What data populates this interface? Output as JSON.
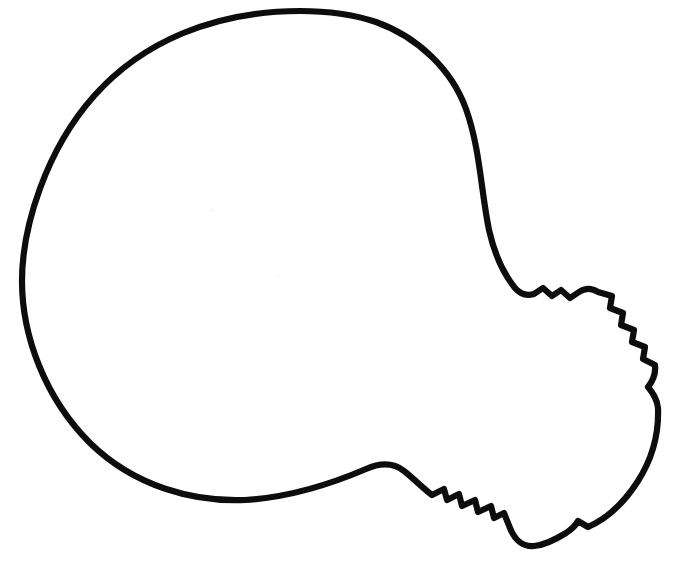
{
  "document": {
    "kind": "line-art-coloring-page",
    "subject": "light bulb",
    "title": "Light Bulb Outline",
    "orientation": "diagonal, bulb to upper-left, screw base to lower-right",
    "width": 675,
    "height": 568
  },
  "colors": {
    "background": "#ffffff",
    "outline": "#0d0d0d",
    "fill": "#ffffff",
    "speckle": "#f4f4f6"
  },
  "render": {
    "stroke_width": 6.2,
    "stroke_width_right_edge": 8.0,
    "stroke_linejoin": "round",
    "stroke_linecap": "round",
    "viewbox": "0 0 675 568"
  },
  "artwork": {
    "shapes": [
      {
        "name": "bulb-outline",
        "description": "Closed outline of an incandescent light bulb: large round glass envelope occupying the upper-left, tapering neck to the lower-right, and a threaded screw base with four ridges on each side terminating in a rounded contact tip.",
        "d": "M 300 11 C 214 11 142 42 94 96 C 46 150 22 227 22 281 C 22 336 45 398 90 443 C 135 487 194 502 245 500 C 296 497 338 481 366 469 C 382 462 395 464 404 471 C 413 478 424 489 432 495 L 444 489 L 447 500 L 459 494 L 462 506 L 475 500 L 478 512 L 491 506 L 494 518 L 504 513 L 510 528 C 515 541 524 547 534 546 C 546 545 558 538 566 533 C 572 529 576 525 578 521 L 588 527 C 606 519 624 503 638 481 C 652 459 659 433 658 408 C 657 398 652 392 648 387 C 652 382 656 374 655 365 L 643 359 L 645 347 L 632 342 L 634 330 L 621 325 L 623 313 L 610 308 L 612 296 L 598 292 C 592 288 585 288 579 292 L 570 298 L 561 290 L 552 296 L 543 288 L 534 294 C 527 296 520 294 515 288 C 502 272 494 252 489 230 C 481 191 480 148 466 109 C 452 70 418 37 376 22 C 352 14 326 11 300 11 Z"
      }
    ],
    "speckles": [
      {
        "left": 211,
        "top": 209,
        "size": 3,
        "opacity": 0.55
      },
      {
        "left": 277,
        "top": 274,
        "size": 3,
        "opacity": 0.5
      },
      {
        "left": 332,
        "top": 299,
        "size": 2,
        "opacity": 0.45
      },
      {
        "left": 307,
        "top": 250,
        "size": 2,
        "opacity": 0.4
      },
      {
        "left": 128,
        "top": 394,
        "size": 2,
        "opacity": 0.4
      }
    ]
  },
  "features": {
    "bulb_envelope": "large near-circular glass globe",
    "neck": "smooth narrowing waist between globe and base",
    "thread_ridges_upper_right": 4,
    "thread_ridges_lower_left": 4,
    "base_tip": "rounded contact cap at far lower-right",
    "notch_right_edge": "small kink on the right contour near mid-height",
    "notch_lower_right": "small step on the lower-right contour"
  }
}
